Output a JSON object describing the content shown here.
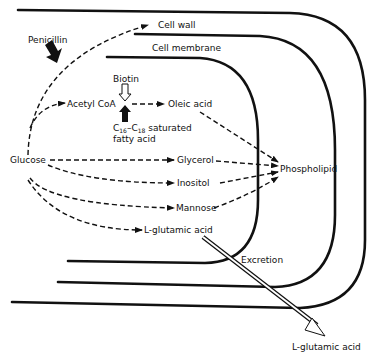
{
  "diagram": {
    "type": "biochemical pathway in bacterial cell",
    "labels": {
      "cell_wall": "Cell wall",
      "cell_membrane": "Cell membrane",
      "penicillin": "Penicillin",
      "biotin": "Biotin",
      "acetyl_coa": "Acetyl CoA",
      "oleic_acid": "Oleic acid",
      "saturated_prefix": "C",
      "saturated_sub1": "16",
      "saturated_dash": "–C",
      "saturated_sub2": "18",
      "saturated_suffix": " saturated",
      "fatty_acid": "fatty acid",
      "glucose": "Glucose",
      "glycerol": "Glycerol",
      "inositol": "Inositol",
      "mannose": "Mannose",
      "glutamic_inner": "L-glutamic acid",
      "phospholipid": "Phospholipid",
      "excretion": "Excretion",
      "glutamic_outer": "L-glutamic acid"
    },
    "edges": [
      {
        "from": "Glucose",
        "to": "Cell wall",
        "style": "dashed"
      },
      {
        "from": "Glucose",
        "to": "Acetyl CoA",
        "style": "dashed"
      },
      {
        "from": "Acetyl CoA",
        "to": "Oleic acid",
        "style": "dashed"
      },
      {
        "from": "Glucose",
        "to": "Glycerol",
        "style": "dashed"
      },
      {
        "from": "Glucose",
        "to": "Inositol",
        "style": "dashed"
      },
      {
        "from": "Glucose",
        "to": "Mannose",
        "style": "dashed"
      },
      {
        "from": "Glucose",
        "to": "L-glutamic acid",
        "style": "dashed"
      },
      {
        "from": "Oleic acid",
        "to": "Phospholipid",
        "style": "dashed"
      },
      {
        "from": "Glycerol",
        "to": "Phospholipid",
        "style": "dashed"
      },
      {
        "from": "Inositol",
        "to": "Phospholipid",
        "style": "dashed"
      },
      {
        "from": "Mannose",
        "to": "Phospholipid",
        "style": "dashed"
      },
      {
        "from": "L-glutamic acid",
        "to": "L-glutamic acid (outside)",
        "style": "hollow-arrow",
        "label": "Excretion"
      },
      {
        "from": "Penicillin",
        "to": "Glucose→Cell wall",
        "style": "inhibitor-arrow"
      },
      {
        "from": "Biotin",
        "to": "Acetyl CoA→Oleic acid",
        "style": "hollow-arrow"
      },
      {
        "from": "C16–C18 saturated fatty acid",
        "to": "Acetyl CoA→Oleic acid",
        "style": "inhibitor-arrow"
      }
    ]
  }
}
